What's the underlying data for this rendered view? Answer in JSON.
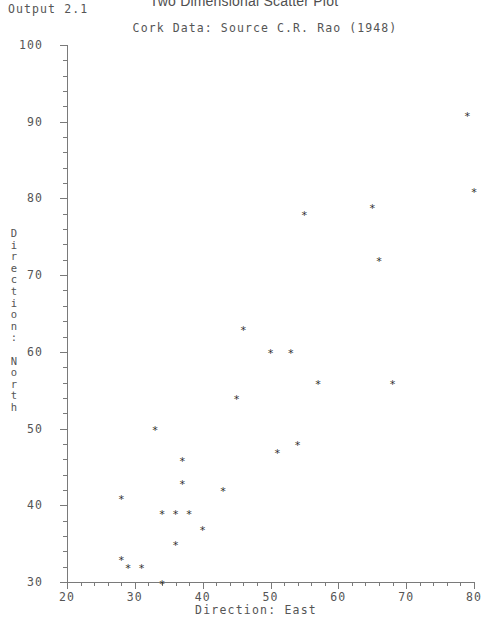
{
  "header": {
    "output_label": "Output 2.1",
    "main_title": "Two Dimensional Scatter Plot",
    "subtitle": "Cork Data: Source C.R. Rao (1948)"
  },
  "chart_data": {
    "type": "scatter",
    "title": "Two Dimensional Scatter Plot",
    "subtitle": "Cork Data: Source C.R. Rao (1948)",
    "xlabel": "Direction: East",
    "ylabel": "Direction: North",
    "xlim": [
      20,
      80
    ],
    "ylim": [
      30,
      100
    ],
    "xticks": [
      20,
      30,
      40,
      50,
      60,
      70,
      80
    ],
    "yticks": [
      30,
      40,
      50,
      60,
      70,
      80,
      90,
      100
    ],
    "x_minor_interval": 2,
    "y_minor_interval": 2,
    "grid": false,
    "legend": null,
    "marker": "*",
    "marker_color": "#2f2f2f",
    "axis_color": "#7a7a7a",
    "points": [
      {
        "x": 28,
        "y": 41
      },
      {
        "x": 28,
        "y": 33
      },
      {
        "x": 29,
        "y": 32
      },
      {
        "x": 31,
        "y": 32
      },
      {
        "x": 33,
        "y": 50
      },
      {
        "x": 34,
        "y": 30
      },
      {
        "x": 34,
        "y": 39
      },
      {
        "x": 36,
        "y": 39
      },
      {
        "x": 36,
        "y": 35
      },
      {
        "x": 37,
        "y": 43
      },
      {
        "x": 37,
        "y": 46
      },
      {
        "x": 38,
        "y": 39
      },
      {
        "x": 40,
        "y": 37
      },
      {
        "x": 43,
        "y": 42
      },
      {
        "x": 45,
        "y": 54
      },
      {
        "x": 46,
        "y": 63
      },
      {
        "x": 50,
        "y": 60
      },
      {
        "x": 51,
        "y": 47
      },
      {
        "x": 53,
        "y": 60
      },
      {
        "x": 54,
        "y": 48
      },
      {
        "x": 55,
        "y": 78
      },
      {
        "x": 57,
        "y": 56
      },
      {
        "x": 65,
        "y": 79
      },
      {
        "x": 66,
        "y": 72
      },
      {
        "x": 68,
        "y": 56
      },
      {
        "x": 79,
        "y": 91
      },
      {
        "x": 80,
        "y": 81
      }
    ]
  },
  "y_axis_title_chars": [
    "D",
    "i",
    "r",
    "e",
    "c",
    "t",
    "i",
    "o",
    "n",
    ":",
    "",
    "N",
    "o",
    "r",
    "t",
    "h"
  ],
  "colors": {
    "text": "#555555",
    "axis": "#7a7a7a",
    "marker": "#2f2f2f",
    "background": "#ffffff"
  }
}
